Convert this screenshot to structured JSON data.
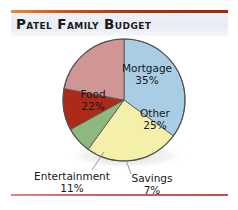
{
  "title": "Patel Family Budget",
  "rules": {
    "top_gradient_start": "#e8883a",
    "top_gradient_end": "#a8240d",
    "bottom_color": "#c9645c"
  },
  "chart_data": {
    "type": "pie",
    "title": "Patel Family Budget",
    "xlabel": "",
    "ylabel": "",
    "legend_position": "none",
    "grid": false,
    "start_angle_deg": 0,
    "direction": "clockwise",
    "categories": [
      "Mortgage",
      "Other",
      "Savings",
      "Entertainment",
      "Food"
    ],
    "values": [
      35,
      25,
      7,
      11,
      22
    ],
    "unit": "%",
    "colors": [
      "#a9cde4",
      "#f5f0a9",
      "#8fb87f",
      "#ad2a18",
      "#cf9695"
    ],
    "slices": [
      {
        "name": "Mortgage",
        "value": 35,
        "label": "Mortgage",
        "percent_label": "35%",
        "color": "#a9cde4",
        "label_placement": "inside"
      },
      {
        "name": "Other",
        "value": 25,
        "label": "Other",
        "percent_label": "25%",
        "color": "#f5f0a9",
        "label_placement": "inside"
      },
      {
        "name": "Savings",
        "value": 7,
        "label": "Savings",
        "percent_label": "7%",
        "color": "#8fb87f",
        "label_placement": "callout"
      },
      {
        "name": "Entertainment",
        "value": 11,
        "label": "Entertainment",
        "percent_label": "11%",
        "color": "#ad2a18",
        "label_placement": "callout"
      },
      {
        "name": "Food",
        "value": 22,
        "label": "Food",
        "percent_label": "22%",
        "color": "#cf9695",
        "label_placement": "inside"
      }
    ]
  }
}
